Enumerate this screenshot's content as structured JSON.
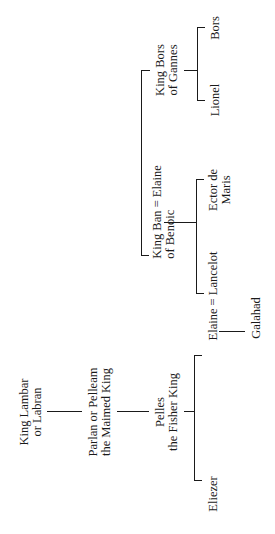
{
  "diagram": {
    "title": "",
    "orientation": "rotated-90-ccw",
    "nodes": {
      "lambar": {
        "line1": "King Lambar",
        "line2": "or Labran"
      },
      "parlan": {
        "line1": "Parlan or Pelleam",
        "line2": "the Maimed King"
      },
      "pelles": {
        "line1": "Pelles",
        "line2": "the Fisher King"
      },
      "eliezer": {
        "line1": "Eliezer"
      },
      "elaine_lancelot": {
        "line1": "Elaine = Lancelot"
      },
      "galahad": {
        "line1": "Galahad"
      },
      "kingban_elaine": {
        "line1": "King Ban = Elaine",
        "line2": "of Benoic"
      },
      "lancelot": {
        "line1": "Lancelot"
      },
      "ector": {
        "line1": "Ector de",
        "line2": "Maris"
      },
      "kingbors": {
        "line1": "King Bors",
        "line2": "of Gannes"
      },
      "lionel": {
        "line1": "Lionel"
      },
      "bors": {
        "line1": "Bors"
      }
    },
    "relations": [
      {
        "parent": "King Lambar or Labran",
        "child": "Parlan or Pelleam the Maimed King"
      },
      {
        "parent": "Parlan or Pelleam the Maimed King",
        "child": "Pelles the Fisher King"
      },
      {
        "parent": "Pelles the Fisher King",
        "children": [
          "Eliezer",
          "Elaine"
        ]
      },
      {
        "marriage": [
          "Elaine",
          "Lancelot"
        ],
        "child": "Galahad"
      },
      {
        "siblings": [
          "King Ban of Benoic",
          "King Bors of Gannes"
        ]
      },
      {
        "marriage": [
          "King Ban of Benoic",
          "Elaine"
        ],
        "children": [
          "Lancelot",
          "Ector de Maris"
        ]
      },
      {
        "parent": "King Bors of Gannes",
        "children": [
          "Lionel",
          "Bors"
        ]
      }
    ],
    "line_color": "#1a1a1a",
    "background": "#ffffff"
  }
}
